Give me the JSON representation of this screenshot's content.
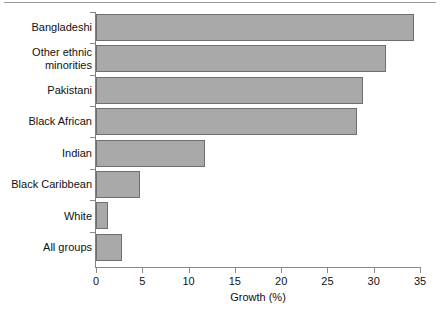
{
  "chart_data": {
    "type": "bar",
    "orientation": "horizontal",
    "title": "",
    "xlabel": "Growth (%)",
    "ylabel": "",
    "xlim": [
      0,
      35
    ],
    "ylim": null,
    "grid": false,
    "legend": null,
    "xticks": [
      0,
      5,
      10,
      15,
      20,
      25,
      30,
      35
    ],
    "xtick_labels": [
      "0",
      "5",
      "10",
      "15",
      "20",
      "25",
      "30",
      "35"
    ],
    "categories": [
      "Bangladeshi",
      "Other ethnic\nminorities",
      "Pakistani",
      "Black African",
      "Indian",
      "Black Caribbean",
      "White",
      "All groups"
    ],
    "values": [
      34.3,
      31.3,
      28.8,
      28.2,
      11.8,
      4.8,
      1.3,
      2.8
    ],
    "bar_fill_color": "#a9a9a9",
    "bar_edge_color": "#6f6f6f",
    "axis_color": "#8a8a8a",
    "text_color": "#111111",
    "background_color": "#ffffff"
  }
}
